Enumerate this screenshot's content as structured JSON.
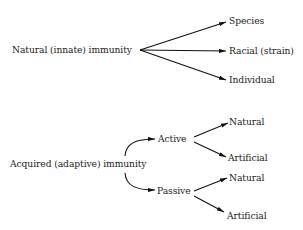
{
  "diagram": {
    "natural": {
      "root": "Natural (innate) immunity",
      "children": [
        "Species",
        "Racial (strain)",
        "Individual"
      ]
    },
    "acquired": {
      "root": "Acquired (adaptive) immunity",
      "branches": [
        {
          "label": "Active",
          "children": [
            "Natural",
            "Artificial"
          ]
        },
        {
          "label": "Passive",
          "children": [
            "Natural",
            "Artificial"
          ]
        }
      ]
    }
  }
}
